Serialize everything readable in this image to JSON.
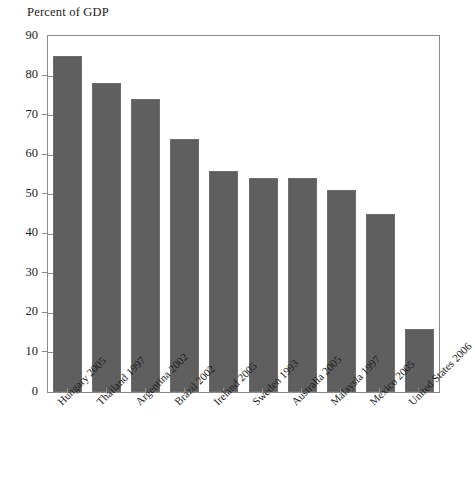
{
  "chart_data": {
    "type": "bar",
    "title": "Percent of GDP",
    "xlabel": "",
    "ylabel": "",
    "ylim": [
      0,
      90
    ],
    "ytick_step": 10,
    "grid": false,
    "legend": null,
    "bar_color": "#5f5f5f",
    "frame_color": "#8b8b8b",
    "categories": [
      "Hungary 2005",
      "Thailand 1997",
      "Argentina 2002",
      "Brazil 2002",
      "Ireland 2005",
      "Sweden 1993",
      "Australia 2005",
      "Malaysia 1997",
      "Mexico 2005",
      "United States 2006"
    ],
    "values": [
      85,
      78,
      74,
      64,
      56,
      54,
      54,
      51,
      45,
      16
    ],
    "yticks": [
      0,
      10,
      20,
      30,
      40,
      50,
      60,
      70,
      80,
      90
    ],
    "ytick_labels": [
      "0",
      "10",
      "20",
      "30",
      "40",
      "50",
      "60",
      "70",
      "80",
      "90"
    ]
  }
}
